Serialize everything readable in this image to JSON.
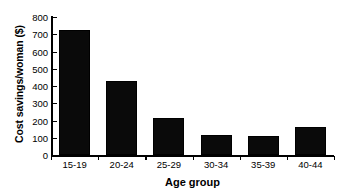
{
  "chart_data": {
    "type": "bar",
    "title": "",
    "subtitle": "",
    "xlabel": "Age group",
    "ylabel": "Cost savings/woman ($)",
    "categories": [
      "15-19",
      "20-24",
      "25-29",
      "30-34",
      "35-39",
      "40-44"
    ],
    "values": [
      725,
      430,
      215,
      115,
      110,
      162
    ],
    "series": [
      {
        "name": "Cost savings per woman",
        "values": [
          725,
          430,
          215,
          115,
          110,
          162
        ]
      }
    ],
    "ylim": [
      0,
      800
    ],
    "ytick_values": [
      0,
      100,
      200,
      300,
      400,
      500,
      600,
      700,
      800
    ],
    "ytick_labels": [
      "0",
      "100",
      "200",
      "300",
      "400",
      "500",
      "600",
      "700",
      "800"
    ],
    "xlim": [
      0,
      6
    ],
    "grid": false,
    "legend": false,
    "legend_position": "none",
    "bar_color": "#0a0a0a",
    "axis_color": "#000000",
    "background_color": "#ffffff"
  }
}
